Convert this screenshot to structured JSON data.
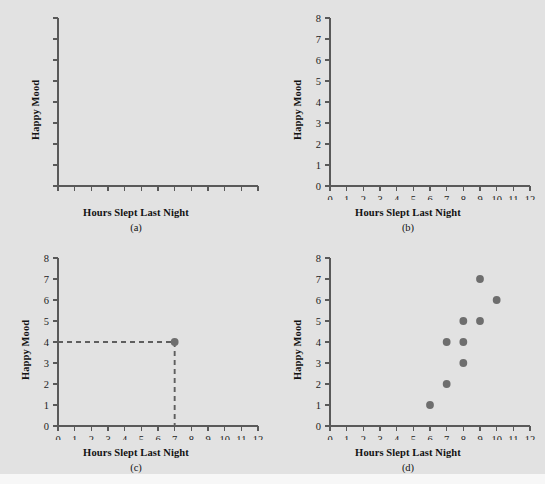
{
  "figure": {
    "background_color": "#e2e2e2",
    "axis_color": "#595959",
    "point_color": "#6e6e6e",
    "text_color": "#121212",
    "xlabel": "Hours Slept Last Night",
    "ylabel": "Happy Mood",
    "captions": {
      "a": "(a)",
      "b": "(b)",
      "c": "(c)",
      "d": "(d)"
    }
  },
  "chart_data": [
    {
      "type": "scatter",
      "panel": "a",
      "title": "",
      "xlabel": "Hours Slept Last Night",
      "ylabel": "Happy Mood",
      "xlim": [
        0,
        12
      ],
      "ylim": [
        0,
        8
      ],
      "xticks": [
        0,
        1,
        2,
        3,
        4,
        5,
        6,
        7,
        8,
        9,
        10,
        11,
        12
      ],
      "yticks": [
        0,
        1,
        2,
        3,
        4,
        5,
        6,
        7,
        8
      ],
      "xticklabels": [
        "",
        "",
        "",
        "",
        "",
        "",
        "",
        "",
        "",
        "",
        "",
        "",
        ""
      ],
      "yticklabels": [
        "",
        "",
        "",
        "",
        "",
        "",
        "",
        "",
        ""
      ],
      "grid": false,
      "legend": "none",
      "points": [],
      "annotation": "Blank axes with unlabeled tick marks"
    },
    {
      "type": "scatter",
      "panel": "b",
      "title": "",
      "xlabel": "Hours Slept Last Night",
      "ylabel": "Happy Mood",
      "xlim": [
        0,
        12
      ],
      "ylim": [
        0,
        8
      ],
      "xticks": [
        0,
        1,
        2,
        3,
        4,
        5,
        6,
        7,
        8,
        9,
        10,
        11,
        12
      ],
      "yticks": [
        0,
        1,
        2,
        3,
        4,
        5,
        6,
        7,
        8
      ],
      "xticklabels": [
        "0",
        "1",
        "2",
        "3",
        "4",
        "5",
        "6",
        "7",
        "8",
        "9",
        "10",
        "11",
        "12"
      ],
      "yticklabels": [
        "0",
        "1",
        "2",
        "3",
        "4",
        "5",
        "6",
        "7",
        "8"
      ],
      "grid": false,
      "legend": "none",
      "points": [],
      "annotation": "Axes with numbered scales, no data plotted"
    },
    {
      "type": "scatter",
      "panel": "c",
      "title": "",
      "xlabel": "Hours Slept Last Night",
      "ylabel": "Happy Mood",
      "xlim": [
        0,
        12
      ],
      "ylim": [
        0,
        8
      ],
      "xticks": [
        0,
        1,
        2,
        3,
        4,
        5,
        6,
        7,
        8,
        9,
        10,
        11,
        12
      ],
      "yticks": [
        0,
        1,
        2,
        3,
        4,
        5,
        6,
        7,
        8
      ],
      "xticklabels": [
        "0",
        "1",
        "2",
        "3",
        "4",
        "5",
        "6",
        "7",
        "8",
        "9",
        "10",
        "11",
        "12"
      ],
      "yticklabels": [
        "0",
        "1",
        "2",
        "3",
        "4",
        "5",
        "6",
        "7",
        "8"
      ],
      "grid": false,
      "legend": "none",
      "points": [
        {
          "x": 7,
          "y": 4
        }
      ],
      "guides": [
        {
          "from": [
            0,
            4
          ],
          "to": [
            7,
            4
          ],
          "style": "dashed"
        },
        {
          "from": [
            7,
            4
          ],
          "to": [
            7,
            0
          ],
          "style": "dashed"
        }
      ],
      "annotation": "Single point at (7, 4) with dashed guide lines to each axis"
    },
    {
      "type": "scatter",
      "panel": "d",
      "title": "",
      "xlabel": "Hours Slept Last Night",
      "ylabel": "Happy Mood",
      "xlim": [
        0,
        12
      ],
      "ylim": [
        0,
        8
      ],
      "xticks": [
        0,
        1,
        2,
        3,
        4,
        5,
        6,
        7,
        8,
        9,
        10,
        11,
        12
      ],
      "yticks": [
        0,
        1,
        2,
        3,
        4,
        5,
        6,
        7,
        8
      ],
      "xticklabels": [
        "0",
        "1",
        "2",
        "3",
        "4",
        "5",
        "6",
        "7",
        "8",
        "9",
        "10",
        "11",
        "12"
      ],
      "yticklabels": [
        "0",
        "1",
        "2",
        "3",
        "4",
        "5",
        "6",
        "7",
        "8"
      ],
      "grid": false,
      "legend": "none",
      "points": [
        {
          "x": 6,
          "y": 1
        },
        {
          "x": 7,
          "y": 2
        },
        {
          "x": 7,
          "y": 4
        },
        {
          "x": 8,
          "y": 3
        },
        {
          "x": 8,
          "y": 4
        },
        {
          "x": 8,
          "y": 5
        },
        {
          "x": 9,
          "y": 5
        },
        {
          "x": 9,
          "y": 7
        },
        {
          "x": 10,
          "y": 6
        }
      ],
      "annotation": "Complete scatterplot of 9 observations showing positive association"
    }
  ]
}
